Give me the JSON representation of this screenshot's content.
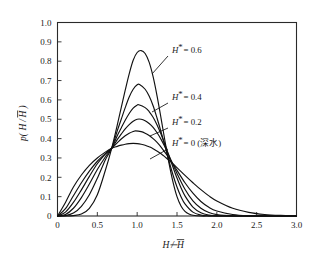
{
  "figure": {
    "background": "#ffffff",
    "line_color": "#111111"
  },
  "chart_data": {
    "type": "line",
    "title": "",
    "subtitle": "",
    "xlabel": "H/H̄",
    "ylabel": "p(H/H̄)",
    "xlim": [
      0,
      3.0
    ],
    "ylim": [
      0,
      1.0
    ],
    "grid": false,
    "legend_position": "inline-annotations",
    "xticks": [
      "0",
      "0.5",
      "1.0",
      "1.5",
      "2.0",
      "2.5",
      "3.0"
    ],
    "xtick_values": [
      0,
      0.5,
      1.0,
      1.5,
      2.0,
      2.5,
      3.0
    ],
    "yticks": [
      "0",
      "0.1",
      "0.2",
      "0.3",
      "0.4",
      "0.5",
      "0.6",
      "0.7",
      "0.8",
      "0.9",
      "1.0"
    ],
    "ytick_values": [
      0,
      0.1,
      0.2,
      0.3,
      0.4,
      0.5,
      0.6,
      0.7,
      0.8,
      0.9,
      1.0
    ],
    "crossing_point": [
      0.68,
      0.35
    ],
    "series": [
      {
        "name": "H* = 0.6",
        "h_star": 0.6,
        "peak_x": 1.05,
        "peak_y": 0.855,
        "x": [
          0.0,
          0.1,
          0.2,
          0.3,
          0.4,
          0.5,
          0.6,
          0.68,
          0.75,
          0.8,
          0.85,
          0.9,
          0.95,
          1.0,
          1.05,
          1.1,
          1.15,
          1.2,
          1.25,
          1.3,
          1.35,
          1.4,
          1.45,
          1.5,
          1.55,
          1.6,
          1.65,
          1.7,
          1.8,
          1.9,
          2.0,
          2.2,
          2.5,
          3.0
        ],
        "y": [
          0.0,
          0.0,
          0.002,
          0.01,
          0.04,
          0.11,
          0.235,
          0.35,
          0.47,
          0.56,
          0.65,
          0.735,
          0.805,
          0.845,
          0.855,
          0.84,
          0.795,
          0.72,
          0.62,
          0.505,
          0.385,
          0.272,
          0.175,
          0.1,
          0.052,
          0.024,
          0.01,
          0.004,
          0.0,
          0.0,
          0.0,
          0.0,
          0.0,
          0.0
        ]
      },
      {
        "name": "H* = 0.5",
        "h_star": 0.5,
        "peak_x": 1.03,
        "peak_y": 0.68,
        "x": [
          0.0,
          0.1,
          0.2,
          0.3,
          0.4,
          0.5,
          0.6,
          0.68,
          0.75,
          0.8,
          0.85,
          0.9,
          0.95,
          1.0,
          1.03,
          1.1,
          1.15,
          1.2,
          1.25,
          1.3,
          1.35,
          1.4,
          1.45,
          1.5,
          1.55,
          1.6,
          1.7,
          1.8,
          1.9,
          2.0,
          2.2,
          2.5,
          3.0
        ],
        "y": [
          0.0,
          0.002,
          0.015,
          0.05,
          0.11,
          0.195,
          0.29,
          0.35,
          0.44,
          0.5,
          0.56,
          0.615,
          0.655,
          0.678,
          0.68,
          0.655,
          0.62,
          0.57,
          0.505,
          0.435,
          0.36,
          0.283,
          0.212,
          0.15,
          0.1,
          0.063,
          0.02,
          0.005,
          0.001,
          0.0,
          0.0,
          0.0,
          0.0
        ]
      },
      {
        "name": "H* = 0.4",
        "h_star": 0.4,
        "peak_x": 1.02,
        "peak_y": 0.575,
        "x": [
          0.0,
          0.1,
          0.2,
          0.3,
          0.4,
          0.5,
          0.6,
          0.68,
          0.75,
          0.8,
          0.85,
          0.9,
          0.95,
          1.0,
          1.02,
          1.1,
          1.15,
          1.2,
          1.25,
          1.3,
          1.35,
          1.4,
          1.45,
          1.5,
          1.55,
          1.6,
          1.7,
          1.8,
          1.9,
          2.0,
          2.2,
          2.5,
          3.0
        ],
        "y": [
          0.0,
          0.008,
          0.04,
          0.095,
          0.165,
          0.24,
          0.305,
          0.35,
          0.415,
          0.455,
          0.495,
          0.53,
          0.558,
          0.573,
          0.575,
          0.56,
          0.54,
          0.51,
          0.47,
          0.422,
          0.368,
          0.31,
          0.252,
          0.196,
          0.146,
          0.104,
          0.046,
          0.017,
          0.005,
          0.001,
          0.0,
          0.0,
          0.0
        ]
      },
      {
        "name": "H* = 0.3",
        "h_star": 0.3,
        "peak_x": 1.0,
        "peak_y": 0.5,
        "x": [
          0.0,
          0.1,
          0.2,
          0.3,
          0.4,
          0.5,
          0.6,
          0.68,
          0.75,
          0.8,
          0.85,
          0.9,
          0.95,
          1.0,
          1.05,
          1.1,
          1.15,
          1.2,
          1.25,
          1.3,
          1.35,
          1.4,
          1.45,
          1.5,
          1.6,
          1.7,
          1.8,
          1.9,
          2.0,
          2.2,
          2.5,
          3.0
        ],
        "y": [
          0.0,
          0.02,
          0.07,
          0.135,
          0.205,
          0.27,
          0.32,
          0.35,
          0.395,
          0.423,
          0.45,
          0.472,
          0.49,
          0.5,
          0.5,
          0.492,
          0.478,
          0.458,
          0.43,
          0.396,
          0.356,
          0.312,
          0.266,
          0.22,
          0.138,
          0.078,
          0.04,
          0.018,
          0.007,
          0.001,
          0.0,
          0.0
        ]
      },
      {
        "name": "H* = 0.2",
        "h_star": 0.2,
        "peak_x": 0.98,
        "peak_y": 0.44,
        "x": [
          0.0,
          0.1,
          0.2,
          0.3,
          0.4,
          0.5,
          0.6,
          0.68,
          0.75,
          0.8,
          0.85,
          0.9,
          0.95,
          0.98,
          1.05,
          1.1,
          1.15,
          1.2,
          1.25,
          1.3,
          1.4,
          1.5,
          1.6,
          1.7,
          1.8,
          1.9,
          2.0,
          2.2,
          2.4,
          2.7,
          3.0
        ],
        "y": [
          0.0,
          0.038,
          0.105,
          0.172,
          0.232,
          0.283,
          0.322,
          0.35,
          0.378,
          0.398,
          0.415,
          0.428,
          0.437,
          0.44,
          0.436,
          0.428,
          0.416,
          0.4,
          0.38,
          0.356,
          0.3,
          0.236,
          0.172,
          0.118,
          0.075,
          0.045,
          0.026,
          0.008,
          0.002,
          0.0,
          0.0
        ]
      },
      {
        "name": "H* = 0 (深水)",
        "h_star": 0,
        "peak_x": 0.95,
        "peak_y": 0.375,
        "x": [
          0.0,
          0.1,
          0.2,
          0.3,
          0.4,
          0.5,
          0.6,
          0.68,
          0.75,
          0.8,
          0.85,
          0.9,
          0.95,
          1.0,
          1.05,
          1.1,
          1.15,
          1.2,
          1.3,
          1.4,
          1.5,
          1.6,
          1.7,
          1.8,
          1.9,
          2.0,
          2.2,
          2.4,
          2.6,
          2.8,
          3.0
        ],
        "y": [
          0.0,
          0.07,
          0.15,
          0.212,
          0.262,
          0.3,
          0.33,
          0.35,
          0.36,
          0.366,
          0.371,
          0.374,
          0.375,
          0.374,
          0.371,
          0.366,
          0.358,
          0.348,
          0.322,
          0.288,
          0.25,
          0.21,
          0.172,
          0.136,
          0.104,
          0.078,
          0.04,
          0.019,
          0.008,
          0.003,
          0.001
        ]
      }
    ],
    "annotations": [
      {
        "id": "h06",
        "text_prefix": "H",
        "text_suffix": " = 0.6",
        "star": "*",
        "label": "H* = 0.6"
      },
      {
        "id": "h04",
        "text_prefix": "H",
        "text_suffix": " = 0.4",
        "star": "*",
        "label": "H* = 0.4"
      },
      {
        "id": "h02",
        "text_prefix": "H",
        "text_suffix": " = 0.2",
        "star": "*",
        "label": "H* = 0.2"
      },
      {
        "id": "h00",
        "text_prefix": "H",
        "text_suffix": " = 0 (深水)",
        "star": "*",
        "label": "H* = 0 (深水)"
      }
    ]
  },
  "axis": {
    "x_title_num": "H",
    "x_title_den": "H",
    "y_title_open": "p(",
    "y_title_num": "H",
    "y_title_den": "H",
    "y_title_close": ")"
  }
}
